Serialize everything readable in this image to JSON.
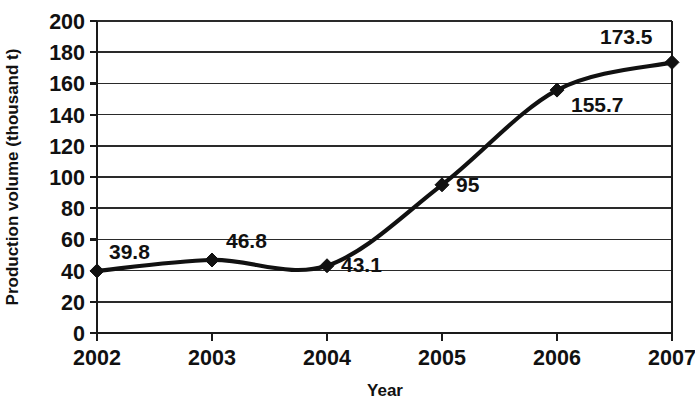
{
  "chart_data": {
    "type": "line",
    "title": "",
    "xlabel": "Year",
    "ylabel": "Production volume (thousand t)",
    "categories": [
      "2002",
      "2003",
      "2004",
      "2005",
      "2006",
      "2007"
    ],
    "x": [
      2002,
      2003,
      2004,
      2005,
      2006,
      2007
    ],
    "values": [
      39.8,
      46.8,
      43.1,
      95,
      155.7,
      173.5
    ],
    "point_labels": [
      "39.8",
      "46.8",
      "43.1",
      "95",
      "155.7",
      "173.5"
    ],
    "series": [
      {
        "name": "Production volume",
        "values": [
          39.8,
          46.8,
          43.1,
          95,
          155.7,
          173.5
        ]
      }
    ],
    "ylim": [
      0,
      200
    ],
    "xlim": [
      2002,
      2007
    ],
    "y_ticks": [
      0,
      20,
      40,
      60,
      80,
      100,
      120,
      140,
      160,
      180,
      200
    ],
    "y_tick_labels": [
      "0",
      "20",
      "40",
      "60",
      "80",
      "100",
      "120",
      "140",
      "160",
      "180",
      "200"
    ],
    "x_ticks": [
      2002,
      2003,
      2004,
      2005,
      2006,
      2007
    ],
    "x_tick_labels": [
      "2002",
      "2003",
      "2004",
      "2005",
      "2006",
      "2007"
    ],
    "grid": true,
    "grid_axis": "y",
    "legend": false,
    "legend_position": "none",
    "line_color": "#111111",
    "marker": "diamond",
    "marker_color": "#111111",
    "smoothing": true,
    "background_color": "#ffffff"
  },
  "axis_titles": {
    "x": "Year",
    "y": "Production volume (thousand t)"
  }
}
